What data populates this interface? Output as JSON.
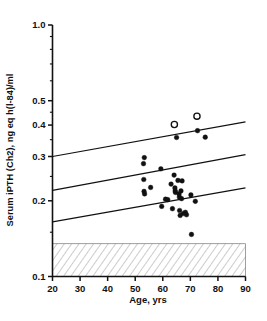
{
  "chart_data": {
    "type": "scatter",
    "title": "",
    "xlabel": "Age, yrs",
    "ylabel": "Serum iPTH (Ch2), ng eq h(l-84)/ml",
    "xlim": [
      20,
      90
    ],
    "ylim": [
      0.1,
      1.0
    ],
    "yscale": "log",
    "xscale": "linear",
    "grid": false,
    "legend": "none",
    "xticks": [
      20,
      30,
      40,
      50,
      60,
      70,
      80,
      90
    ],
    "xtick_labels": [
      "20",
      "30",
      "40",
      "50",
      "60",
      "70",
      "80",
      "90"
    ],
    "yticks": [
      1.0,
      0.5,
      0.4,
      0.3,
      0.2,
      0.1
    ],
    "ytick_labels": [
      "1.0",
      "0.5",
      "0.4",
      "0.3",
      "0.2",
      "0.1"
    ],
    "points": [
      {
        "x": 53.3,
        "y": 0.297
      },
      {
        "x": 53.0,
        "y": 0.281
      },
      {
        "x": 53.1,
        "y": 0.243
      },
      {
        "x": 53.2,
        "y": 0.218
      },
      {
        "x": 53.4,
        "y": 0.213
      },
      {
        "x": 55.6,
        "y": 0.226
      },
      {
        "x": 59.3,
        "y": 0.268
      },
      {
        "x": 59.6,
        "y": 0.19
      },
      {
        "x": 61.0,
        "y": 0.203
      },
      {
        "x": 61.8,
        "y": 0.202
      },
      {
        "x": 63.0,
        "y": 0.233
      },
      {
        "x": 63.5,
        "y": 0.186
      },
      {
        "x": 64.2,
        "y": 0.402
      },
      {
        "x": 64.1,
        "y": 0.253
      },
      {
        "x": 64.4,
        "y": 0.225
      },
      {
        "x": 64.5,
        "y": 0.219
      },
      {
        "x": 64.6,
        "y": 0.216
      },
      {
        "x": 65.0,
        "y": 0.357
      },
      {
        "x": 65.5,
        "y": 0.241
      },
      {
        "x": 65.9,
        "y": 0.213
      },
      {
        "x": 66.0,
        "y": 0.207
      },
      {
        "x": 66.1,
        "y": 0.183
      },
      {
        "x": 66.3,
        "y": 0.175
      },
      {
        "x": 66.6,
        "y": 0.219
      },
      {
        "x": 66.8,
        "y": 0.204
      },
      {
        "x": 67.0,
        "y": 0.24
      },
      {
        "x": 67.4,
        "y": 0.178
      },
      {
        "x": 68.2,
        "y": 0.18
      },
      {
        "x": 68.6,
        "y": 0.176
      },
      {
        "x": 70.2,
        "y": 0.211
      },
      {
        "x": 70.4,
        "y": 0.147
      },
      {
        "x": 71.8,
        "y": 0.199
      },
      {
        "x": 72.4,
        "y": 0.434
      },
      {
        "x": 72.6,
        "y": 0.38
      },
      {
        "x": 75.4,
        "y": 0.358
      }
    ],
    "open_points": [
      {
        "x": 64.2,
        "y": 0.402
      },
      {
        "x": 72.4,
        "y": 0.434
      }
    ],
    "lines": [
      {
        "name": "upper-confidence-line",
        "x0": 20,
        "y0": 0.3,
        "x1": 90,
        "y1": 0.412
      },
      {
        "name": "regression-line",
        "x0": 20,
        "y0": 0.22,
        "x1": 90,
        "y1": 0.305
      },
      {
        "name": "lower-confidence-line",
        "x0": 20,
        "y0": 0.165,
        "x1": 90,
        "y1": 0.225
      }
    ],
    "band": {
      "name": "normal-range-band",
      "y_low": 0.1,
      "y_high": 0.135,
      "style": "hatched"
    }
  }
}
